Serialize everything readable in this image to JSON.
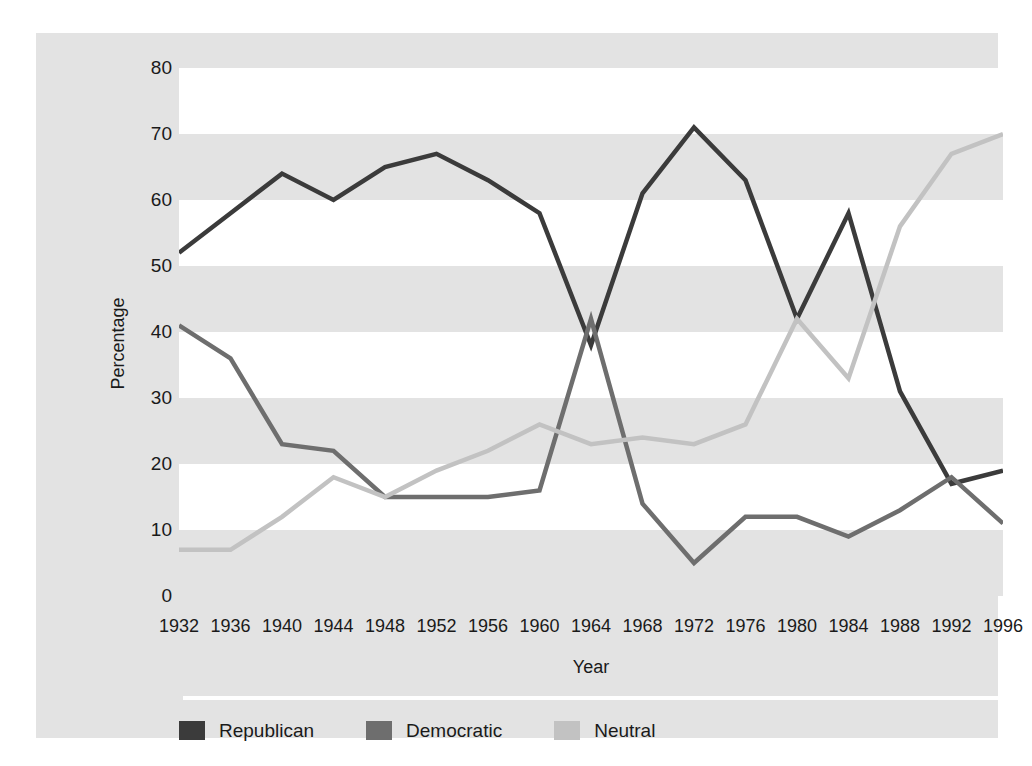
{
  "chart_data": {
    "type": "line",
    "title": "",
    "xlabel": "Year",
    "ylabel": "Percentage",
    "xlim": [
      1932,
      1996
    ],
    "ylim": [
      0,
      80
    ],
    "grid": "horizontal-bands",
    "legend_position": "bottom-left",
    "x": [
      1932,
      1936,
      1940,
      1944,
      1948,
      1952,
      1956,
      1960,
      1964,
      1968,
      1972,
      1976,
      1980,
      1984,
      1988,
      1992,
      1996
    ],
    "xticklabels": [
      "1932",
      "1936",
      "1940",
      "1944",
      "1948",
      "1952",
      "1956",
      "1960",
      "1964",
      "1968",
      "1972",
      "1976",
      "1980",
      "1984",
      "1988",
      "1992",
      "1996"
    ],
    "yticklabels": [
      "80",
      "70",
      "60",
      "50",
      "40",
      "30",
      "20",
      "10",
      "0"
    ],
    "yticks": [
      80,
      70,
      60,
      50,
      40,
      30,
      20,
      10,
      0
    ],
    "series": [
      {
        "name": "Republican",
        "color": "#3b3b3b",
        "values": [
          52,
          58,
          64,
          60,
          65,
          67,
          63,
          58,
          38,
          61,
          71,
          63,
          42,
          58,
          31,
          17,
          19
        ]
      },
      {
        "name": "Democratic",
        "color": "#6e6e6e",
        "values": [
          41,
          36,
          23,
          22,
          15,
          15,
          15,
          16,
          42,
          14,
          5,
          12,
          12,
          9,
          13,
          18,
          11
        ]
      },
      {
        "name": "Neutral",
        "color": "#c2c2c2",
        "values": [
          7,
          7,
          12,
          18,
          15,
          19,
          22,
          26,
          23,
          24,
          23,
          26,
          42,
          33,
          56,
          67,
          70
        ]
      }
    ]
  },
  "axis": {
    "y_title": "Percentage",
    "x_title": "Year"
  },
  "legend": {
    "items": [
      {
        "label": "Republican",
        "color": "#3b3b3b"
      },
      {
        "label": "Democratic",
        "color": "#6e6e6e"
      },
      {
        "label": "Neutral",
        "color": "#c2c2c2"
      }
    ]
  },
  "style": {
    "figure_background": "#ffffff",
    "panel_background": "#e3e3e3",
    "band_light": "#ffffff",
    "band_dark": "#e3e3e3",
    "text_color": "#1a1a1a",
    "axis_line_color": "#ffffff"
  }
}
